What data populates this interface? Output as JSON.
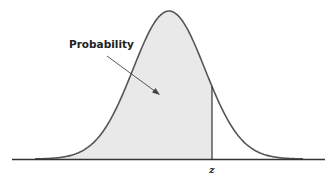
{
  "figure": {
    "type": "normal-distribution-diagram",
    "annotation_label": "Probability",
    "z_label": "z",
    "colors": {
      "curve": "#555555",
      "fill": "#e9e9e9",
      "axis": "#333333",
      "arrow": "#444444"
    }
  },
  "chart_data": {
    "type": "area",
    "title": "",
    "xlabel": "",
    "ylabel": "",
    "distribution": "standard normal",
    "shaded_region": "left of z",
    "annotations": [
      "Probability",
      "z"
    ],
    "grid": false
  }
}
